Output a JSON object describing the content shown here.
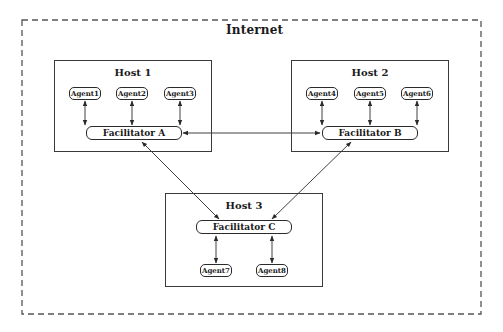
{
  "diagram": {
    "region_label": "Internet",
    "hosts": [
      {
        "title": "Host 1",
        "facilitator": "Facilitator A",
        "agents": [
          "Agent1",
          "Agent2",
          "Agent3"
        ]
      },
      {
        "title": "Host 2",
        "facilitator": "Facilitator B",
        "agents": [
          "Agent4",
          "Agent5",
          "Agent6"
        ]
      },
      {
        "title": "Host 3",
        "facilitator": "Facilitator C",
        "agents": [
          "Agent7",
          "Agent8"
        ]
      }
    ],
    "connections": [
      {
        "from": "Agent1",
        "to": "Facilitator A",
        "type": "bidirectional"
      },
      {
        "from": "Agent2",
        "to": "Facilitator A",
        "type": "bidirectional"
      },
      {
        "from": "Agent3",
        "to": "Facilitator A",
        "type": "bidirectional"
      },
      {
        "from": "Agent4",
        "to": "Facilitator B",
        "type": "bidirectional"
      },
      {
        "from": "Agent5",
        "to": "Facilitator B",
        "type": "bidirectional"
      },
      {
        "from": "Agent6",
        "to": "Facilitator B",
        "type": "bidirectional"
      },
      {
        "from": "Facilitator C",
        "to": "Agent7",
        "type": "bidirectional"
      },
      {
        "from": "Facilitator C",
        "to": "Agent8",
        "type": "bidirectional"
      },
      {
        "from": "Facilitator A",
        "to": "Facilitator B",
        "type": "bidirectional"
      },
      {
        "from": "Facilitator A",
        "to": "Facilitator C",
        "type": "bidirectional"
      },
      {
        "from": "Facilitator B",
        "to": "Facilitator C",
        "type": "bidirectional"
      }
    ],
    "colors": {
      "line": "#2a2a2a",
      "dashed_border": "#555555",
      "background": "#ffffff"
    }
  }
}
